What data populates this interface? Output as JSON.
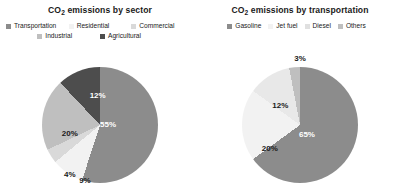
{
  "figure": {
    "background": "#ffffff",
    "panels": [
      {
        "name": "sector",
        "title_main": "CO",
        "title_sub": "2",
        "title_rest": " emissions by sector",
        "title_full": "CO2 emissions by sector",
        "legend": [
          {
            "label": "Transportation",
            "color": "#8c8c8c"
          },
          {
            "label": "Residential",
            "color": "#f2f2f2"
          },
          {
            "label": "Commercial",
            "color": "#d9d9d9"
          },
          {
            "label": "Industrial",
            "color": "#bfbfbf"
          },
          {
            "label": "Agricultural",
            "color": "#4d4d4d"
          }
        ],
        "pie": {
          "center_x": 100,
          "center_y": 125,
          "radius": 58,
          "start_angle": 0
        },
        "slices": [
          {
            "label": "Transportation",
            "value": 55,
            "text": "55%",
            "color": "#8c8c8c",
            "text_color": "#ffffff",
            "lx": 57,
            "ly": 49
          },
          {
            "label": "Residential",
            "value": 9,
            "text": "9%",
            "color": "#f2f2f2",
            "text_color": "#1a1a1a",
            "lx": 37,
            "ly": 97
          },
          {
            "label": "Commercial",
            "value": 4,
            "text": "4%",
            "color": "#d9d9d9",
            "text_color": "#1a1a1a",
            "lx": 24,
            "ly": 92
          },
          {
            "label": "Industrial",
            "value": 20,
            "text": "20%",
            "color": "#bfbfbf",
            "text_color": "#1a1a1a",
            "lx": 24,
            "ly": 57
          },
          {
            "label": "Agricultural",
            "value": 12,
            "text": "12%",
            "color": "#4d4d4d",
            "text_color": "#ffffff",
            "lx": 48,
            "ly": 24
          }
        ]
      },
      {
        "name": "transportation",
        "title_main": "CO",
        "title_sub": "2",
        "title_rest": " emissions by transportation",
        "title_full": "CO2 emissions by transportation",
        "legend": [
          {
            "label": "Gasoline",
            "color": "#8c8c8c"
          },
          {
            "label": "Jet fuel",
            "color": "#f2f2f2"
          },
          {
            "label": "Diesel",
            "color": "#e0e0e0"
          },
          {
            "label": "Others",
            "color": "#bfbfbf"
          }
        ],
        "pie": {
          "center_x": 100,
          "center_y": 125,
          "radius": 58,
          "start_angle": 0
        },
        "slices": [
          {
            "label": "Gasoline",
            "value": 65,
            "text": "65%",
            "color": "#8c8c8c",
            "text_color": "#ffffff",
            "lx": 56,
            "ly": 58
          },
          {
            "label": "Jet fuel",
            "value": 20,
            "text": "20%",
            "color": "#f2f2f2",
            "text_color": "#1a1a1a",
            "lx": 24,
            "ly": 70
          },
          {
            "label": "Diesel",
            "value": 12,
            "text": "12%",
            "color": "#e8e8e8",
            "text_color": "#1a1a1a",
            "lx": 33,
            "ly": 33
          },
          {
            "label": "Others",
            "value": 3,
            "text": "3%",
            "color": "#bfbfbf",
            "text_color": "#1a1a1a",
            "lx": 50,
            "ly": -8
          }
        ]
      }
    ]
  },
  "chart_data": [
    {
      "type": "pie",
      "title": "CO2 emissions by sector",
      "categories": [
        "Transportation",
        "Residential",
        "Commercial",
        "Industrial",
        "Agricultural"
      ],
      "values": [
        55,
        9,
        4,
        20,
        12
      ],
      "labels": [
        "55%",
        "9%",
        "4%",
        "20%",
        "12%"
      ],
      "colors": [
        "#8c8c8c",
        "#f2f2f2",
        "#d9d9d9",
        "#bfbfbf",
        "#4d4d4d"
      ],
      "units": "percent",
      "legend_position": "top",
      "grid": false
    },
    {
      "type": "pie",
      "title": "CO2 emissions by transportation",
      "categories": [
        "Gasoline",
        "Jet fuel",
        "Diesel",
        "Others"
      ],
      "values": [
        65,
        20,
        12,
        3
      ],
      "labels": [
        "65%",
        "20%",
        "12%",
        "3%"
      ],
      "colors": [
        "#8c8c8c",
        "#f2f2f2",
        "#e0e0e0",
        "#bfbfbf"
      ],
      "units": "percent",
      "legend_position": "top",
      "grid": false
    }
  ]
}
